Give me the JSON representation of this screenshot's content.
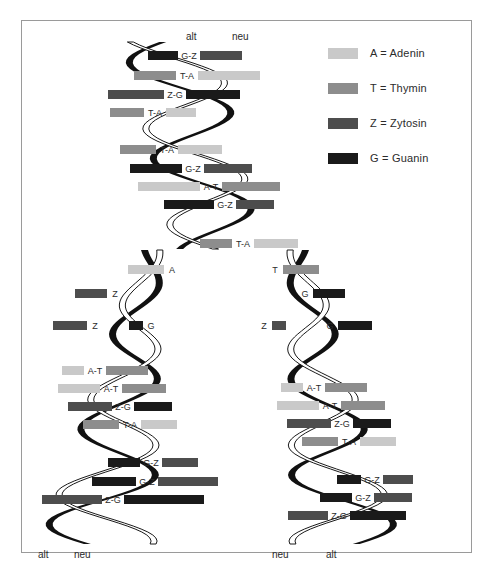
{
  "figure": {
    "background": "#ffffff",
    "border_color": "#9a9a9a"
  },
  "colors": {
    "A": "#c9c9c9",
    "T": "#8d8d8d",
    "Z": "#4d4d4d",
    "G": "#1a1a1a",
    "strand_old": "#111111",
    "strand_new_fill": "#ffffff",
    "strand_new_stroke": "#1a1a1a",
    "text": "#2b2b2b"
  },
  "legend": {
    "items": [
      {
        "key": "A",
        "swatch": "#c9c9c9",
        "label": "A = Adenin"
      },
      {
        "key": "T",
        "swatch": "#8d8d8d",
        "label": "T = Thymin"
      },
      {
        "key": "Z",
        "swatch": "#4d4d4d",
        "label": "Z = Zytosin"
      },
      {
        "key": "G",
        "swatch": "#1a1a1a",
        "label": "G = Guanin"
      }
    ]
  },
  "strand_end_labels": {
    "top_old": "alt",
    "top_new": "neu",
    "bottom_left_old": "alt",
    "bottom_left_new": "neu",
    "bottom_right_new": "neu",
    "bottom_right_old": "alt"
  },
  "chart_data": {
    "type": "diagram",
    "parent_helix": {
      "region": "top",
      "base_pairs": [
        "G-Z",
        "T-A",
        "Z-G",
        "T-A",
        "T-A",
        "G-Z",
        "A-T",
        "G-Z",
        "T-A"
      ]
    },
    "fork": {
      "left_branch_unpaired": [
        "A",
        "Z",
        "Z"
      ],
      "left_branch_new_unpaired": [
        "G"
      ],
      "right_branch_unpaired": [
        "T",
        "G",
        "Z"
      ],
      "right_branch_new_unpaired": [
        "G"
      ]
    },
    "daughter_helix_left": {
      "base_pairs": [
        "A-T",
        "A-T",
        "Z-G",
        "T-A",
        "G-Z",
        "G-Z",
        "Z-G"
      ]
    },
    "daughter_helix_right": {
      "base_pairs": [
        "A-T",
        "A-T",
        "Z-G",
        "T-A",
        "G-Z",
        "G-Z",
        "Z-G"
      ]
    }
  },
  "base_pairs_top": [
    {
      "label": "G-Z",
      "x": 148,
      "y": 51,
      "lw": 30,
      "rw": 42,
      "left": "G",
      "right": "Z",
      "swap": true
    },
    {
      "label": "T-A",
      "x": 134,
      "y": 71,
      "lw": 42,
      "rw": 62,
      "left": "T",
      "right": "A"
    },
    {
      "label": "Z-G",
      "x": 108,
      "y": 90,
      "lw": 56,
      "rw": 54,
      "left": "Z",
      "right": "G"
    },
    {
      "label": "T-A",
      "x": 110,
      "y": 108,
      "lw": 34,
      "rw": 30,
      "left": "T",
      "right": "A"
    },
    {
      "label": "T-A",
      "x": 120,
      "y": 145,
      "lw": 36,
      "rw": 44,
      "left": "T",
      "right": "A"
    },
    {
      "label": "G-Z",
      "x": 130,
      "y": 164,
      "lw": 52,
      "rw": 48,
      "left": "G",
      "right": "Z"
    },
    {
      "label": "A-T",
      "x": 138,
      "y": 182,
      "lw": 62,
      "rw": 58,
      "left": "A",
      "right": "T"
    },
    {
      "label": "G-Z",
      "x": 164,
      "y": 200,
      "lw": 50,
      "rw": 38,
      "left": "G",
      "right": "Z"
    },
    {
      "label": "T-A",
      "x": 200,
      "y": 239,
      "lw": 32,
      "rw": 44,
      "left": "T",
      "right": "A"
    }
  ],
  "singles_left": [
    {
      "label": "A",
      "x": 128,
      "y": 265,
      "w": 36,
      "color": "A"
    },
    {
      "label": "Z",
      "x": 75,
      "y": 289,
      "w": 32,
      "color": "Z"
    },
    {
      "label": "Z",
      "x": 53,
      "y": 321,
      "w": 34,
      "color": "Z"
    },
    {
      "label": "G",
      "x": 129,
      "y": 321,
      "w": 14,
      "color": "G"
    }
  ],
  "singles_right": [
    {
      "label": "T",
      "x": 283,
      "y": 265,
      "w": 36,
      "color": "T"
    },
    {
      "label": "G",
      "x": 313,
      "y": 289,
      "w": 32,
      "color": "G"
    },
    {
      "label": "Z",
      "x": 272,
      "y": 321,
      "w": 14,
      "color": "Z"
    },
    {
      "label": "G",
      "x": 338,
      "y": 321,
      "w": 34,
      "color": "G"
    }
  ],
  "base_pairs_left_daughter": [
    {
      "label": "A-T",
      "x": 62,
      "y": 366,
      "lw": 22,
      "rw": 42,
      "left": "A",
      "right": "T"
    },
    {
      "label": "A-T",
      "x": 58,
      "y": 384,
      "lw": 42,
      "rw": 44,
      "left": "A",
      "right": "T"
    },
    {
      "label": "Z-G",
      "x": 68,
      "y": 402,
      "lw": 44,
      "rw": 38,
      "left": "Z",
      "right": "G"
    },
    {
      "label": "T-A",
      "x": 83,
      "y": 420,
      "lw": 36,
      "rw": 36,
      "left": "T",
      "right": "A"
    },
    {
      "label": "G-Z",
      "x": 108,
      "y": 458,
      "lw": 32,
      "rw": 36,
      "left": "G",
      "right": "Z"
    },
    {
      "label": "G-Z",
      "x": 92,
      "y": 477,
      "lw": 44,
      "rw": 60,
      "left": "G",
      "right": "Z"
    },
    {
      "label": "Z-G",
      "x": 42,
      "y": 495,
      "lw": 60,
      "rw": 80,
      "left": "Z",
      "right": "G"
    }
  ],
  "base_pairs_right_daughter": [
    {
      "label": "A-T",
      "x": 281,
      "y": 383,
      "lw": 22,
      "rw": 42,
      "left": "A",
      "right": "T"
    },
    {
      "label": "A-T",
      "x": 277,
      "y": 401,
      "lw": 42,
      "rw": 44,
      "left": "A",
      "right": "T"
    },
    {
      "label": "Z-G",
      "x": 287,
      "y": 419,
      "lw": 44,
      "rw": 38,
      "left": "Z",
      "right": "G"
    },
    {
      "label": "T-A",
      "x": 302,
      "y": 437,
      "lw": 36,
      "rw": 36,
      "left": "T",
      "right": "A"
    },
    {
      "label": "G-Z",
      "x": 337,
      "y": 475,
      "lw": 24,
      "rw": 30,
      "left": "G",
      "right": "Z"
    },
    {
      "label": "G-Z",
      "x": 320,
      "y": 493,
      "lw": 32,
      "rw": 38,
      "left": "G",
      "right": "Z"
    },
    {
      "label": "Z-G",
      "x": 288,
      "y": 511,
      "lw": 40,
      "rw": 56,
      "left": "Z",
      "right": "G"
    }
  ],
  "end_label_positions": {
    "top_old": {
      "x": 186,
      "y": 31
    },
    "top_new": {
      "x": 232,
      "y": 31
    },
    "bl_old": {
      "x": 38,
      "y": 549
    },
    "bl_new": {
      "x": 74,
      "y": 549
    },
    "br_new": {
      "x": 272,
      "y": 549
    },
    "br_old": {
      "x": 326,
      "y": 549
    }
  }
}
